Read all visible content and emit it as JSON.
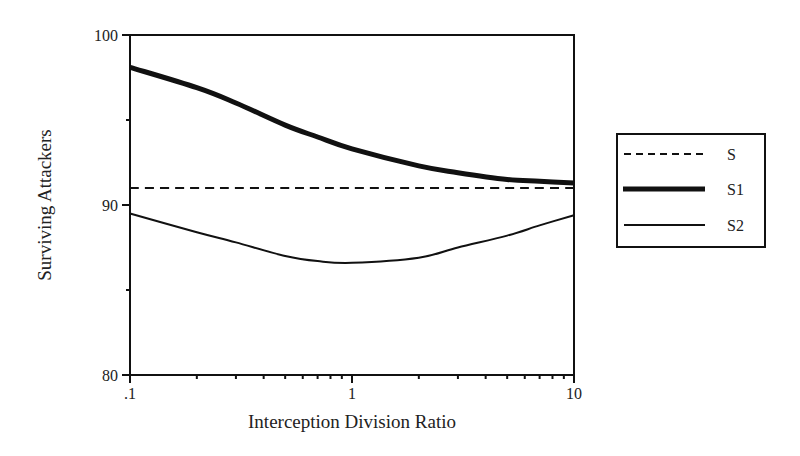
{
  "chart_data": {
    "type": "line",
    "title": "",
    "xlabel": "Interception Division Ratio",
    "ylabel": "Surviving Attackers",
    "xscale": "log",
    "xlim": [
      0.1,
      10
    ],
    "ylim": [
      80,
      100
    ],
    "x_ticks": [
      {
        "value": 0.1,
        "label": ".1"
      },
      {
        "value": 1,
        "label": "1"
      },
      {
        "value": 10,
        "label": "10"
      }
    ],
    "y_ticks": [
      {
        "value": 80,
        "label": "80"
      },
      {
        "value": 90,
        "label": "90"
      },
      {
        "value": 100,
        "label": "100"
      }
    ],
    "y_minor_ticks": [
      85,
      95
    ],
    "grid": false,
    "legend_position": "right",
    "x": [
      0.1,
      0.2,
      0.3,
      0.5,
      0.7,
      1,
      2,
      3,
      5,
      7,
      10
    ],
    "series": [
      {
        "name": "S",
        "style": "dashed",
        "width": 2,
        "values": [
          91,
          91,
          91,
          91,
          91,
          91,
          91,
          91,
          91,
          91,
          91
        ]
      },
      {
        "name": "S1",
        "style": "solid",
        "width": 5,
        "values": [
          98.1,
          96.9,
          96.0,
          94.7,
          94.0,
          93.3,
          92.3,
          91.9,
          91.5,
          91.4,
          91.3
        ]
      },
      {
        "name": "S2",
        "style": "solid",
        "width": 2,
        "values": [
          89.5,
          88.4,
          87.8,
          87.0,
          86.7,
          86.6,
          86.9,
          87.5,
          88.2,
          88.8,
          89.4
        ]
      }
    ]
  },
  "labels": {
    "xlabel": "Interception Division Ratio",
    "ylabel": "Surviving Attackers",
    "y100": "100",
    "y90": "90",
    "y80": "80",
    "x01": ".1",
    "x1": "1",
    "x10": "10"
  },
  "legend": {
    "items": [
      {
        "label": "S"
      },
      {
        "label": "S1"
      },
      {
        "label": "S2"
      }
    ]
  }
}
